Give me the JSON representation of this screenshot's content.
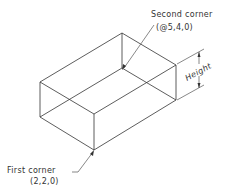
{
  "diagram": {
    "type": "isometric-box",
    "line_color": "#333333",
    "background": "#ffffff",
    "labels": {
      "second_corner": "Second corner",
      "second_corner_coords": "(@5,4,0)",
      "first_corner": "First corner",
      "first_corner_coords": "(2,2,0)",
      "height": "Height"
    }
  }
}
